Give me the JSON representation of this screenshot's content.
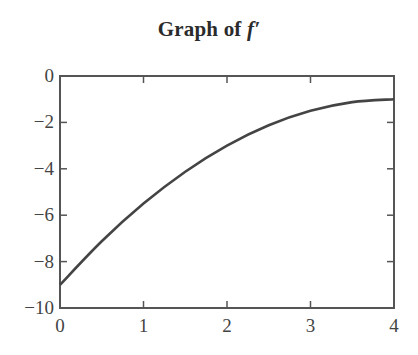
{
  "title": {
    "prefix": "Graph of ",
    "function": "f′"
  },
  "chart_data": {
    "type": "line",
    "title": "Graph of f′",
    "xlabel": "",
    "ylabel": "",
    "xlim": [
      0,
      4
    ],
    "ylim": [
      -10,
      0
    ],
    "xticks": [
      0,
      1,
      2,
      3,
      4
    ],
    "xtick_labels": [
      "0",
      "1",
      "2",
      "3",
      "4"
    ],
    "yticks": [
      0,
      -2,
      -4,
      -6,
      -8,
      -10
    ],
    "ytick_labels": [
      "0",
      "−2",
      "−4",
      "−6",
      "−8",
      "−10"
    ],
    "grid": false,
    "legend": null,
    "series": [
      {
        "name": "f′",
        "x": [
          0,
          0.5,
          1,
          1.5,
          2,
          2.5,
          3,
          3.5,
          4
        ],
        "y": [
          -9,
          -7.125,
          -5.5,
          -4.125,
          -3,
          -2.125,
          -1.5,
          -1.125,
          -1
        ]
      }
    ],
    "colors": {
      "line": "#444444",
      "axis": "#555555"
    }
  }
}
